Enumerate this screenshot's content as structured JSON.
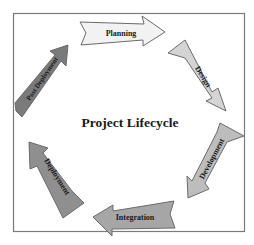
{
  "diagram": {
    "title": "Project Lifecycle",
    "frame": {
      "x": 13,
      "y": 13,
      "w": 232,
      "h": 219,
      "stroke": "#7a7a7a"
    },
    "stages": [
      {
        "label": "Planning",
        "fill": "#f2f2f2"
      },
      {
        "label": "Design",
        "fill": "#d4d4d4"
      },
      {
        "label": "Development",
        "fill": "#bdbdbd"
      },
      {
        "label": "Integration",
        "fill": "#a6a6a6"
      },
      {
        "label": "Deployment",
        "fill": "#8f8f8f"
      },
      {
        "label": "Post Deployment",
        "fill": "#7a7a7a"
      }
    ],
    "arrow_stroke": "#6b6b6b",
    "text_color": "#1a1a1a"
  }
}
